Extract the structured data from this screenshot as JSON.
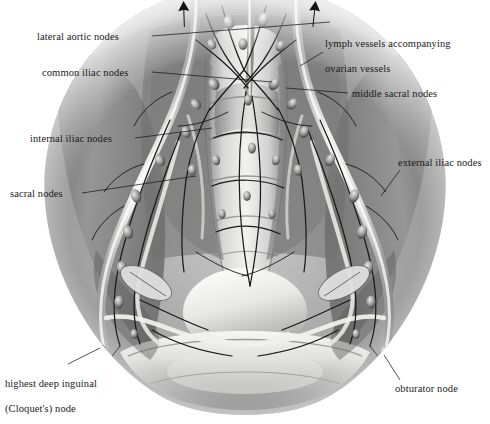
{
  "figure": {
    "width": 490,
    "height": 424,
    "background_color": "#ffffff",
    "ink_color": "#1a1a1a",
    "style": "grayscale airbrush medical illustration"
  },
  "labels": [
    {
      "id": "lateral-aortic-nodes",
      "text": "lateral aortic nodes",
      "lines": [
        "lateral aortic nodes"
      ],
      "x": 37,
      "y": 31,
      "align": "left",
      "leader": {
        "x1": 152,
        "y1": 36,
        "x2": 330,
        "y2": 22
      }
    },
    {
      "id": "common-iliac-nodes",
      "text": "common iliac nodes",
      "lines": [
        "common iliac nodes"
      ],
      "x": 42,
      "y": 67,
      "align": "left",
      "leader": {
        "x1": 152,
        "y1": 72,
        "x2": 272,
        "y2": 82
      }
    },
    {
      "id": "internal-iliac-nodes",
      "text": "internal iliac nodes",
      "lines": [
        "internal iliac nodes"
      ],
      "x": 30,
      "y": 133,
      "align": "left",
      "leader": {
        "x1": 135,
        "y1": 138,
        "x2": 212,
        "y2": 128
      }
    },
    {
      "id": "sacral-nodes",
      "text": "sacral nodes",
      "lines": [
        "sacral nodes"
      ],
      "x": 10,
      "y": 188,
      "align": "left",
      "leader": {
        "x1": 82,
        "y1": 193,
        "x2": 196,
        "y2": 176
      }
    },
    {
      "id": "lymph-vessels-ovarian",
      "text": "lymph vessels accompanying ovarian vessels",
      "lines": [
        "lymph vessels accompanying",
        "ovarian vessels"
      ],
      "x": 325,
      "y": 25,
      "align": "left",
      "leader": {
        "x1": 323,
        "y1": 52,
        "x2": 300,
        "y2": 66
      }
    },
    {
      "id": "middle-sacral-nodes",
      "text": "middle sacral nodes",
      "lines": [
        "middle sacral nodes"
      ],
      "x": 352,
      "y": 88,
      "align": "left",
      "leader": {
        "x1": 348,
        "y1": 93,
        "x2": 286,
        "y2": 88
      }
    },
    {
      "id": "external-iliac-nodes",
      "text": "external iliac nodes",
      "lines": [
        "external iliac nodes"
      ],
      "x": 398,
      "y": 157,
      "align": "left",
      "leader": {
        "x1": 400,
        "y1": 170,
        "x2": 381,
        "y2": 196
      }
    },
    {
      "id": "highest-deep-inguinal-node",
      "text": "highest deep inguinal (Cloquet's) node",
      "lines": [
        "highest deep inguinal",
        "(Cloquet's) node"
      ],
      "x": 5,
      "y": 365,
      "align": "left",
      "leader": {
        "x1": 68,
        "y1": 364,
        "x2": 100,
        "y2": 348
      }
    },
    {
      "id": "obturator-node",
      "text": "obturator node",
      "lines": [
        "obturator node"
      ],
      "x": 395,
      "y": 383,
      "align": "left",
      "leader": {
        "x1": 400,
        "y1": 380,
        "x2": 384,
        "y2": 355
      }
    }
  ],
  "arrows": [
    {
      "id": "arrow-left-drainage",
      "x": 183,
      "y_top": 2,
      "y_bottom": 27,
      "tilt": -2
    },
    {
      "id": "arrow-right-drainage",
      "x": 315,
      "y_top": 2,
      "y_bottom": 27,
      "tilt": 6
    }
  ],
  "anatomy": {
    "structures": [
      "sacrum",
      "sacral promontory",
      "iliac fossa",
      "pubic symphysis",
      "common iliac vessels",
      "external iliac vessels",
      "internal iliac vessels",
      "ovarian vessels",
      "obturator nerve",
      "ureter"
    ],
    "node_chains": [
      "lateral aortic",
      "common iliac",
      "internal iliac",
      "external iliac",
      "sacral",
      "middle sacral",
      "obturator",
      "highest deep inguinal"
    ]
  }
}
